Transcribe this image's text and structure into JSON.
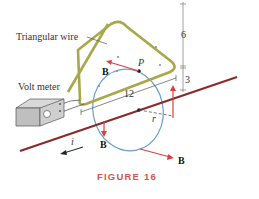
{
  "labels": {
    "triangular_wire": "Triangular wire",
    "volt_meter": "Volt meter",
    "point_p": "P",
    "b_top": "B",
    "b_left": "B",
    "b_bottom": "B",
    "dim_6": "6",
    "dim_3": "3",
    "dim_12": "12",
    "radius": "r",
    "current": "i"
  },
  "caption": "FIGURE 16",
  "colors": {
    "wire": "#a8a84a",
    "straight_wire": "#8b2a2a",
    "field_arrow": "#d94040",
    "circle": "#6a9fd0",
    "caption": "#d9534f"
  }
}
